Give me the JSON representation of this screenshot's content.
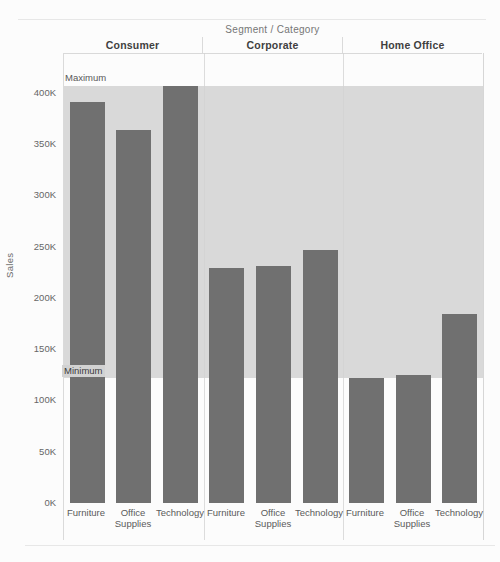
{
  "chart_data": {
    "type": "bar",
    "title": "Segment / Category",
    "ylabel": "Sales",
    "ylim": [
      0,
      438700
    ],
    "grid": false,
    "legend": "none",
    "segments": [
      "Consumer",
      "Corporate",
      "Home Office"
    ],
    "categories": [
      "Furniture",
      "Office Supplies",
      "Technology"
    ],
    "series": [
      {
        "segment": "Consumer",
        "values": [
          391000,
          364000,
          406400
        ]
      },
      {
        "segment": "Corporate",
        "values": [
          229000,
          230700,
          246500
        ]
      },
      {
        "segment": "Home Office",
        "values": [
          121900,
          124400,
          184000
        ]
      }
    ],
    "reference_band": {
      "from": 121900,
      "to": 406400,
      "from_label": "Minimum",
      "to_label": "Maximum"
    },
    "ytick_labels": [
      "0K",
      "50K",
      "100K",
      "150K",
      "200K",
      "250K",
      "300K",
      "350K",
      "400K"
    ],
    "ytick_values": [
      0,
      50000,
      100000,
      150000,
      200000,
      250000,
      300000,
      350000,
      400000
    ],
    "bar_color": "#707070",
    "band_color": "#d9d9d9"
  }
}
